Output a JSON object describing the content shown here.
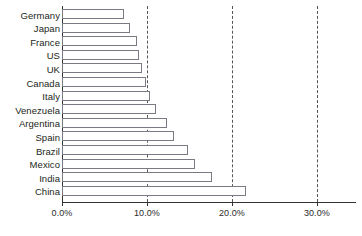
{
  "chart_data": {
    "type": "bar",
    "orientation": "horizontal",
    "title": "",
    "subtitle": "",
    "xlabel": "",
    "ylabel": "",
    "categories": [
      "Germany",
      "Japan",
      "France",
      "US",
      "UK",
      "Canada",
      "Italy",
      "Venezuela",
      "Argentina",
      "Spain",
      "Brazil",
      "Mexico",
      "India",
      "China"
    ],
    "values": [
      7.3,
      8.0,
      8.8,
      9.1,
      9.4,
      9.9,
      10.4,
      11.1,
      12.4,
      13.2,
      14.8,
      15.6,
      17.6,
      21.6
    ],
    "value_unit": "%",
    "xlim": [
      0,
      30
    ],
    "xticks": [
      0,
      10,
      20,
      30
    ],
    "xtick_labels": [
      "0.0%",
      "10.0%",
      "20.0%",
      "30.0%"
    ],
    "grid": "vertical-dashed",
    "legend": null,
    "bar_fill": "#ffffff",
    "bar_stroke": "#7a7a85",
    "axis_color": "#333333",
    "gridline_color": "#555555",
    "text_color": "#231f20"
  }
}
